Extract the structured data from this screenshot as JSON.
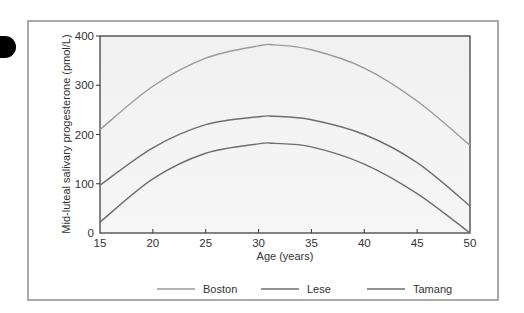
{
  "chart_data": {
    "type": "line",
    "title": "",
    "xlabel": "Age (years)",
    "ylabel": "Mid-luteal salivary progesterone (pmol/L)",
    "xlim": [
      15,
      50
    ],
    "ylim": [
      0,
      400
    ],
    "xticks": [
      15,
      20,
      25,
      30,
      35,
      40,
      45,
      50
    ],
    "yticks": [
      0,
      100,
      200,
      300,
      400
    ],
    "grid": false,
    "legend_position": "bottom",
    "x": [
      15,
      20,
      25,
      30,
      31.5,
      35,
      40,
      45,
      50
    ],
    "series": [
      {
        "name": "Boston",
        "color": "#9a9a9a",
        "values": [
          210,
          298,
          355,
          380,
          382,
          372,
          335,
          268,
          178
        ]
      },
      {
        "name": "Lese",
        "color": "#6e6e6e",
        "values": [
          97,
          173,
          220,
          236,
          237,
          230,
          200,
          143,
          55
        ]
      },
      {
        "name": "Tamang",
        "color": "#6e6e6e",
        "values": [
          22,
          110,
          162,
          181,
          182,
          175,
          140,
          80,
          0
        ]
      }
    ]
  },
  "legend": {
    "items": [
      {
        "label": "Boston",
        "color": "#9a9a9a"
      },
      {
        "label": "Lese",
        "color": "#6e6e6e"
      },
      {
        "label": "Tamang",
        "color": "#6e6e6e"
      }
    ]
  },
  "axes": {
    "x_title": "Age (years)",
    "y_title": "Mid-luteal salivary progesterone (pmol/L)",
    "x_tick_labels": [
      "15",
      "20",
      "25",
      "30",
      "35",
      "40",
      "45",
      "50"
    ],
    "y_tick_labels": [
      "0",
      "100",
      "200",
      "300",
      "400"
    ]
  }
}
